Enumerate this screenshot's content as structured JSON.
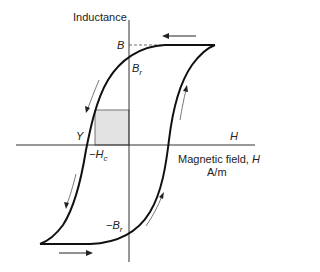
{
  "diagram": {
    "y_axis_label": "Inductance",
    "x_axis_label": "Magnetic field, ",
    "x_axis_symbol": "H",
    "x_axis_unit": "A/m",
    "axis_end_label": "H",
    "labels": {
      "saturation": "B",
      "remanence_pos": "B",
      "remanence_pos_sub": "r",
      "remanence_neg": "−B",
      "remanence_neg_sub": "r",
      "coercivity": "−H",
      "coercivity_sub": "c",
      "point_y": "Y"
    },
    "colors": {
      "curve": "#111111",
      "axis": "#333333",
      "shaded_region": "#e3e3e3",
      "arrow": "#222222",
      "flow_arrow": "#555555"
    }
  }
}
